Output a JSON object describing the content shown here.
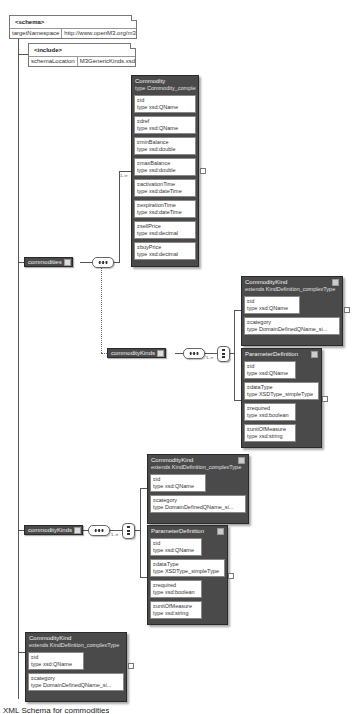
{
  "schema": {
    "title": "<schema>",
    "attr_name": "targetNamespace",
    "attr_value": "http://www.openM3.org/m3"
  },
  "include": {
    "title": "<include>",
    "attr_name": "schemaLocation",
    "attr_value": "M3GenericKinds.xsd"
  },
  "commodity_type": {
    "title": "Commodity",
    "subtitle": "type  Commodity_complexType",
    "attributes": [
      {
        "name": "id",
        "type": "type  xsd:QName"
      },
      {
        "name": "dref",
        "type": "type  xsd:QName"
      },
      {
        "name": "minBalance",
        "type": "type  xsd:double"
      },
      {
        "name": "maxBalance",
        "type": "type  xsd:double"
      },
      {
        "name": "activationTime",
        "type": "type  xsd:dateTime"
      },
      {
        "name": "expirationTime",
        "type": "type  xsd:dateTime"
      },
      {
        "name": "sellPrice",
        "type": "type  xsd:decimal"
      },
      {
        "name": "buyPrice",
        "type": "type  xsd:decimal"
      }
    ]
  },
  "elements": {
    "commodities": "commodities",
    "commodity_kinds_inner": "commodityKinds",
    "commodity_kinds_outer": "commodityKinds"
  },
  "cardinality": {
    "commodity": "1..∞",
    "kinds_inner": "1..∞",
    "kinds_outer": "1..∞"
  },
  "commodity_kind": {
    "title": "CommodityKind",
    "subtitle": "extends  KindDefinition_complexType",
    "attributes": [
      {
        "name": "id",
        "type": "type  xsd:QName"
      },
      {
        "name": "category",
        "type": "type  DomainDefinedQName_si..."
      }
    ]
  },
  "parameter_definition": {
    "title": "ParameterDefinition",
    "attributes": [
      {
        "name": "id",
        "type": "type  xsd:QName"
      },
      {
        "name": "dataType",
        "type": "type  XSDType_simpleType"
      },
      {
        "name": "required",
        "type": "type  xsd:boolean"
      },
      {
        "name": "unitOfMeasure",
        "type": "type  xsd:string"
      }
    ]
  },
  "caption": "XML Schema for commodities"
}
